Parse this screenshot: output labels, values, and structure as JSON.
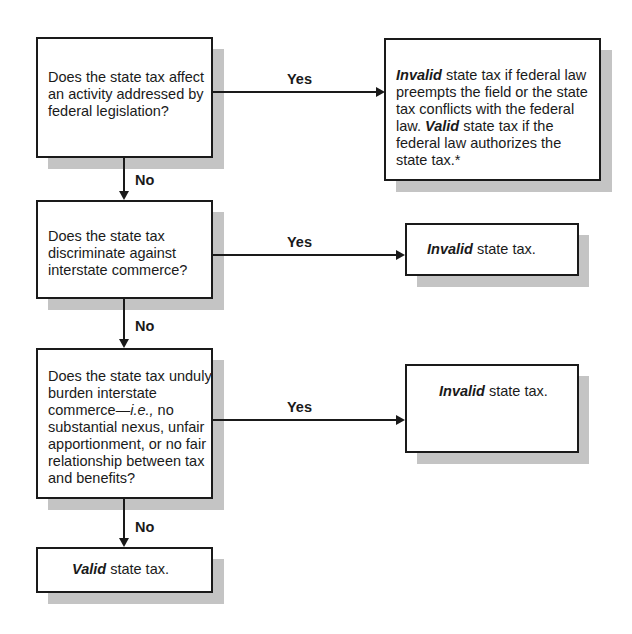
{
  "nodes": {
    "q1": {
      "text": "Does the state tax affect an activity addressed by federal legislation?"
    },
    "r1": {
      "bold1": "Invalid",
      "text1": " state tax if federal law preempts the field or the state tax conflicts with the federal law. ",
      "bold2": "Valid",
      "text2": " state tax if the federal law authorizes the state tax.*"
    },
    "q2": {
      "text": "Does the state tax discriminate against interstate commerce?"
    },
    "r2": {
      "bold": "Invalid",
      "text": " state tax."
    },
    "q3": {
      "text_a": "Does the state tax unduly burden interstate commerce—",
      "italic": "i.e.,",
      "text_b": " no substantial nexus, unfair apportionment, or no fair relationship between tax and benefits?"
    },
    "r3": {
      "bold": "Invalid",
      "text": " state tax."
    },
    "end": {
      "bold": "Valid",
      "text": " state tax."
    }
  },
  "edges": {
    "yes": "Yes",
    "no": "No"
  }
}
